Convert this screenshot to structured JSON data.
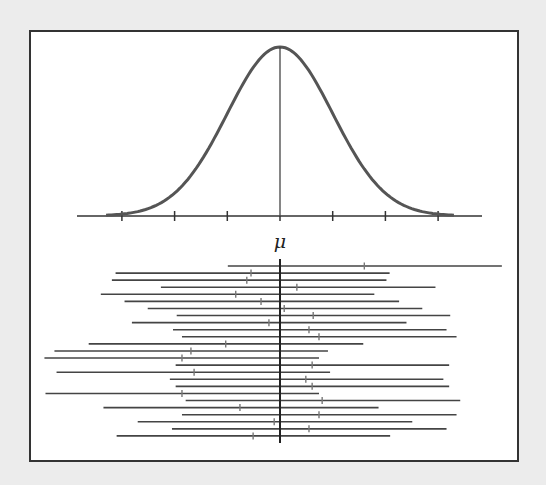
{
  "diagram": {
    "title": "",
    "mean_label": "μ",
    "colors": {
      "background": "#ececec",
      "frame": "#333333",
      "curve": "#555555",
      "axis": "#333333",
      "intervals": "#444444",
      "interval_ticks": "#777777"
    }
  },
  "chart_data": [
    {
      "type": "line",
      "title": "Normal distribution density",
      "xlabel": "μ",
      "ylabel": "",
      "axis_ticks_sigma": [
        -3,
        -2,
        -1,
        0,
        1,
        2,
        3
      ],
      "center_label": "μ",
      "grid": false,
      "description": "Bell curve centered at μ with vertical line at the mean and tick marks at ±1σ, ±2σ, ±3σ"
    },
    {
      "type": "interval",
      "title": "Confidence intervals from repeated samples",
      "reference_line": "μ",
      "units": "sigma (relative to μ)",
      "intervals": [
        {
          "lower": -0.99,
          "estimate": 1.6,
          "upper": 4.21
        },
        {
          "lower": -3.12,
          "estimate": -0.55,
          "upper": 2.08
        },
        {
          "lower": -3.19,
          "estimate": -0.63,
          "upper": 2.02
        },
        {
          "lower": -2.26,
          "estimate": 0.32,
          "upper": 2.95
        },
        {
          "lower": -3.4,
          "estimate": -0.84,
          "upper": 1.79
        },
        {
          "lower": -2.95,
          "estimate": -0.36,
          "upper": 2.26
        },
        {
          "lower": -2.51,
          "estimate": 0.08,
          "upper": 2.7
        },
        {
          "lower": -1.96,
          "estimate": 0.63,
          "upper": 3.23
        },
        {
          "lower": -2.81,
          "estimate": -0.21,
          "upper": 2.4
        },
        {
          "lower": -2.03,
          "estimate": 0.55,
          "upper": 3.16
        },
        {
          "lower": -1.86,
          "estimate": 0.74,
          "upper": 3.35
        },
        {
          "lower": -3.63,
          "estimate": -1.03,
          "upper": 1.58
        },
        {
          "lower": -4.28,
          "estimate": -1.69,
          "upper": 0.91
        },
        {
          "lower": -4.47,
          "estimate": -1.86,
          "upper": 0.74
        },
        {
          "lower": -1.98,
          "estimate": 0.61,
          "upper": 3.21
        },
        {
          "lower": -4.24,
          "estimate": -1.63,
          "upper": 0.95
        },
        {
          "lower": -2.09,
          "estimate": 0.49,
          "upper": 3.1
        },
        {
          "lower": -1.98,
          "estimate": 0.61,
          "upper": 3.21
        },
        {
          "lower": -4.45,
          "estimate": -1.86,
          "upper": 0.74
        },
        {
          "lower": -1.79,
          "estimate": 0.8,
          "upper": 3.42
        },
        {
          "lower": -3.35,
          "estimate": -0.76,
          "upper": 1.87
        },
        {
          "lower": -1.86,
          "estimate": 0.74,
          "upper": 3.35
        },
        {
          "lower": -2.7,
          "estimate": -0.11,
          "upper": 2.51
        },
        {
          "lower": -2.05,
          "estimate": 0.55,
          "upper": 3.16
        },
        {
          "lower": -3.1,
          "estimate": -0.51,
          "upper": 2.09
        }
      ],
      "intervals_missing_mu": 1,
      "total_intervals": 25
    }
  ]
}
